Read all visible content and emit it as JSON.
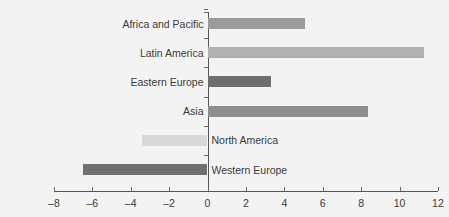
{
  "chart_data": {
    "type": "bar",
    "orientation": "horizontal",
    "title": "",
    "subtitle": "",
    "xlabel": "",
    "ylabel": "",
    "xlim": [
      -8,
      12
    ],
    "xticks": [
      -8,
      -6,
      -4,
      -2,
      0,
      2,
      4,
      6,
      8,
      10,
      12
    ],
    "xtick_labels": [
      "–8",
      "–6",
      "–4",
      "–2",
      "0",
      "2",
      "4",
      "6",
      "8",
      "10",
      "12"
    ],
    "grid": false,
    "legend": false,
    "categories": [
      "Africa and Pacific",
      "Latin America",
      "Eastern Europe",
      "Asia",
      "North America",
      "Western Europe"
    ],
    "values": [
      5.1,
      11.3,
      3.3,
      8.35,
      -3.4,
      -6.5
    ],
    "bar_colors": [
      "#9a9a9a",
      "#b0b0b0",
      "#6e6e6e",
      "#8e8e8e",
      "#d8d8d8",
      "#707070"
    ]
  },
  "style": {
    "background": "#f3f3f3",
    "axis_color": "#555555",
    "tick_color": "#6a6a6a",
    "text_color": "#3a3a3a"
  }
}
